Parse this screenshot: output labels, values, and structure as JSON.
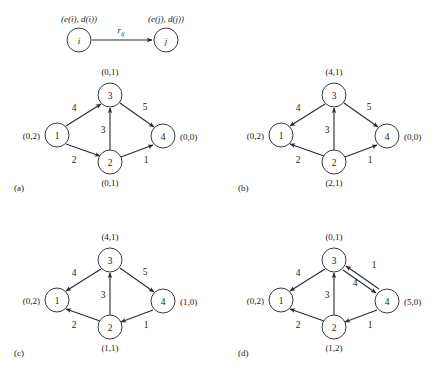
{
  "figure": {
    "title": "",
    "background": "#ffffff",
    "ink_color": "#2b2b2b",
    "node_fill": "#ffffff",
    "node_stroke": "#3a3a3a"
  },
  "legend": {
    "source_state": "(e(i), d(i))",
    "target_state": "(e(j), d(j))",
    "source_node": "i",
    "target_node": "j",
    "edge_weight": "r",
    "edge_weight_sub": "ij"
  },
  "panels": [
    {
      "key": "a",
      "caption": "(a)",
      "nodes": [
        {
          "id": "1",
          "state": "(0,2)",
          "pos": "left"
        },
        {
          "id": "2",
          "state": "(0,1)",
          "pos": "bottom"
        },
        {
          "id": "3",
          "state": "(0,1)",
          "pos": "top"
        },
        {
          "id": "4",
          "state": "(0,0)",
          "pos": "right"
        }
      ],
      "edges": [
        {
          "from": "1",
          "to": "3",
          "weight": "4"
        },
        {
          "from": "1",
          "to": "2",
          "weight": "2"
        },
        {
          "from": "2",
          "to": "3",
          "weight": "3"
        },
        {
          "from": "3",
          "to": "4",
          "weight": "5"
        },
        {
          "from": "2",
          "to": "4",
          "weight": "1"
        }
      ]
    },
    {
      "key": "b",
      "caption": "(b)",
      "nodes": [
        {
          "id": "1",
          "state": "(0,2)",
          "pos": "left"
        },
        {
          "id": "2",
          "state": "(2,1)",
          "pos": "bottom"
        },
        {
          "id": "3",
          "state": "(4,1)",
          "pos": "top"
        },
        {
          "id": "4",
          "state": "(0,0)",
          "pos": "right"
        }
      ],
      "edges": [
        {
          "from": "3",
          "to": "1",
          "weight": "4"
        },
        {
          "from": "2",
          "to": "1",
          "weight": "2"
        },
        {
          "from": "2",
          "to": "3",
          "weight": "3"
        },
        {
          "from": "3",
          "to": "4",
          "weight": "5"
        },
        {
          "from": "2",
          "to": "4",
          "weight": "1"
        }
      ]
    },
    {
      "key": "c",
      "caption": "(c)",
      "nodes": [
        {
          "id": "1",
          "state": "(0,2)",
          "pos": "left"
        },
        {
          "id": "2",
          "state": "(1,1)",
          "pos": "bottom"
        },
        {
          "id": "3",
          "state": "(4,1)",
          "pos": "top"
        },
        {
          "id": "4",
          "state": "(1,0)",
          "pos": "right"
        }
      ],
      "edges": [
        {
          "from": "3",
          "to": "1",
          "weight": "4"
        },
        {
          "from": "2",
          "to": "1",
          "weight": "2"
        },
        {
          "from": "2",
          "to": "3",
          "weight": "3"
        },
        {
          "from": "3",
          "to": "4",
          "weight": "5"
        },
        {
          "from": "4",
          "to": "2",
          "weight": "1"
        }
      ]
    },
    {
      "key": "d",
      "caption": "(d)",
      "nodes": [
        {
          "id": "1",
          "state": "(0,2)",
          "pos": "left"
        },
        {
          "id": "2",
          "state": "(1,2)",
          "pos": "bottom"
        },
        {
          "id": "3",
          "state": "(0,1)",
          "pos": "top"
        },
        {
          "id": "4",
          "state": "(5,0)",
          "pos": "right"
        }
      ],
      "edges": [
        {
          "from": "3",
          "to": "1",
          "weight": "4"
        },
        {
          "from": "2",
          "to": "1",
          "weight": "2"
        },
        {
          "from": "2",
          "to": "3",
          "weight": "3"
        },
        {
          "from": "4",
          "to": "3",
          "weight": "1"
        },
        {
          "from": "3",
          "to": "4",
          "weight": "4"
        },
        {
          "from": "4",
          "to": "2",
          "weight": "1"
        }
      ]
    }
  ]
}
